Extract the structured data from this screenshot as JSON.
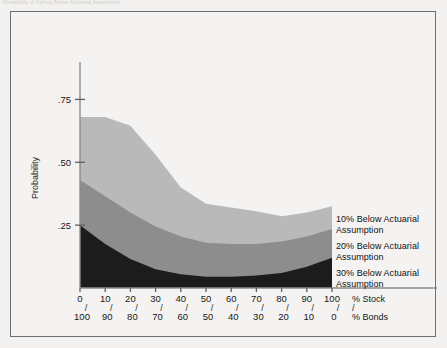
{
  "caption_fragment": "Probability of Falling Below Actuarial Assumption",
  "chart_data": {
    "type": "area",
    "title": "",
    "xlabel_primary": "% Stock",
    "xlabel_secondary": "% Bonds",
    "ylabel": "Probability",
    "ylim": [
      0,
      0.875
    ],
    "ytick_values": [
      0.25,
      0.5,
      0.75
    ],
    "ytick_labels": [
      ".25",
      ".50",
      ".75"
    ],
    "xlim": [
      0,
      100
    ],
    "xtick_values": [
      0,
      10,
      20,
      30,
      40,
      50,
      60,
      70,
      80,
      90,
      100
    ],
    "xtick_labels_stock": [
      "0",
      "10",
      "20",
      "30",
      "40",
      "50",
      "60",
      "70",
      "80",
      "90",
      "100"
    ],
    "xtick_labels_bonds": [
      "100",
      "90",
      "80",
      "70",
      "60",
      "50",
      "40",
      "30",
      "20",
      "10",
      "0"
    ],
    "tick_separator": "/",
    "grid": false,
    "legend_position": "right",
    "stacked": false,
    "x": [
      0,
      10,
      20,
      30,
      40,
      50,
      60,
      70,
      80,
      90,
      100
    ],
    "series": [
      {
        "name": "10% Below Actuarial Assumption",
        "color": "#b9b9b9",
        "values": [
          0.68,
          0.68,
          0.645,
          0.53,
          0.4,
          0.335,
          0.32,
          0.305,
          0.285,
          0.3,
          0.325
        ]
      },
      {
        "name": "20% Below Actuarial Assumption",
        "color": "#8d8d8d",
        "values": [
          0.43,
          0.365,
          0.3,
          0.245,
          0.205,
          0.18,
          0.175,
          0.175,
          0.185,
          0.205,
          0.235
        ]
      },
      {
        "name": "30% Below Actuarial Assumption",
        "color": "#1c1c1c",
        "values": [
          0.25,
          0.175,
          0.115,
          0.075,
          0.055,
          0.045,
          0.045,
          0.05,
          0.06,
          0.085,
          0.12
        ]
      }
    ]
  },
  "legend": {
    "items": [
      {
        "label_line1": "10% Below Actuarial",
        "label_line2": "Assumption"
      },
      {
        "label_line1": "20% Below Actuarial",
        "label_line2": "Assumption"
      },
      {
        "label_line1": "30% Below Actuarial",
        "label_line2": "Assumption"
      }
    ]
  },
  "colors": {
    "band_light": "#b9b9b9",
    "band_medium": "#8d8d8d",
    "band_dark": "#1c1c1c",
    "frame": "#6d6f73",
    "page_background": "#f2f1ef",
    "figure_background": "#f4f3f1"
  }
}
